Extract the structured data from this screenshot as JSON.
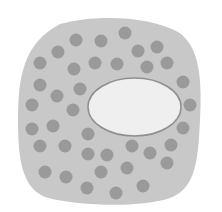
{
  "diagram": {
    "colors": {
      "background": "#ffffff",
      "cell_body": "#c8c8c8",
      "granule": "#9a9a9a",
      "nucleus_fill": "#efefef",
      "nucleus_stroke": "#8f8f8f"
    },
    "cell_body": {
      "path": "M 60 24 C 95 14, 150 16, 178 32 C 200 46, 202 80, 200 120 C 198 160, 196 188, 170 198 C 140 208, 80 206, 48 198 C 22 190, 18 160, 18 120 C 18 80, 22 44, 60 24 Z"
    },
    "nucleus": {
      "cx": 134.5,
      "cy": 107,
      "rx": 46.5,
      "ry": 29
    },
    "granule_radius": 6.5,
    "granules": [
      [
        125,
        33
      ],
      [
        76,
        40
      ],
      [
        101,
        41
      ],
      [
        58,
        52
      ],
      [
        138,
        51
      ],
      [
        157,
        47
      ],
      [
        40,
        63
      ],
      [
        95,
        63
      ],
      [
        117,
        64
      ],
      [
        74,
        69
      ],
      [
        147,
        67
      ],
      [
        167,
        63
      ],
      [
        40,
        85
      ],
      [
        80,
        89
      ],
      [
        57,
        96
      ],
      [
        183,
        82
      ],
      [
        32,
        105
      ],
      [
        73,
        110
      ],
      [
        190,
        105
      ],
      [
        53,
        126
      ],
      [
        32,
        129
      ],
      [
        88,
        134
      ],
      [
        183,
        128
      ],
      [
        40,
        146
      ],
      [
        65,
        146
      ],
      [
        132,
        146
      ],
      [
        88,
        154
      ],
      [
        107,
        155
      ],
      [
        150,
        153
      ],
      [
        171,
        145
      ],
      [
        45,
        172
      ],
      [
        66,
        177
      ],
      [
        101,
        172
      ],
      [
        127,
        168
      ],
      [
        167,
        163
      ],
      [
        87,
        188
      ],
      [
        116,
        193
      ],
      [
        143,
        186
      ]
    ]
  }
}
